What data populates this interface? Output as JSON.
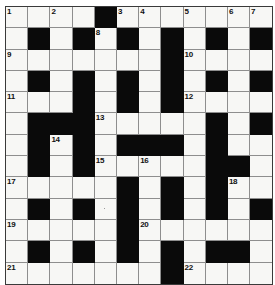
{
  "puzzle": {
    "title": "Crossword Grid",
    "rows": 13,
    "columns": 12,
    "cell_size_px": 22,
    "colors": {
      "block": "#0a0a0a",
      "open": "#f7f7f5",
      "gridline": "#8e8e8e",
      "border": "#3a3a3a",
      "number_text": "#111111",
      "background": "#ffffff"
    },
    "clue_numbers_visible": [
      1,
      2,
      3,
      4,
      5,
      6,
      7,
      8,
      9,
      10,
      11,
      12,
      13,
      14,
      15,
      16,
      17,
      18,
      19,
      20,
      21,
      22
    ],
    "grid": [
      [
        {
          "block": false,
          "num": "1"
        },
        {
          "block": false,
          "num": ""
        },
        {
          "block": false,
          "num": "2"
        },
        {
          "block": false,
          "num": ""
        },
        {
          "block": true,
          "num": ""
        },
        {
          "block": false,
          "num": "3"
        },
        {
          "block": false,
          "num": "4"
        },
        {
          "block": false,
          "num": ""
        },
        {
          "block": false,
          "num": "5"
        },
        {
          "block": false,
          "num": ""
        },
        {
          "block": false,
          "num": "6"
        },
        {
          "block": false,
          "num": "7"
        }
      ],
      [
        {
          "block": false,
          "num": ""
        },
        {
          "block": true,
          "num": ""
        },
        {
          "block": false,
          "num": ""
        },
        {
          "block": true,
          "num": ""
        },
        {
          "block": false,
          "num": "8"
        },
        {
          "block": true,
          "num": ""
        },
        {
          "block": false,
          "num": ""
        },
        {
          "block": true,
          "num": ""
        },
        {
          "block": false,
          "num": ""
        },
        {
          "block": true,
          "num": ""
        },
        {
          "block": false,
          "num": ""
        },
        {
          "block": true,
          "num": ""
        }
      ],
      [
        {
          "block": false,
          "num": "9"
        },
        {
          "block": false,
          "num": ""
        },
        {
          "block": false,
          "num": ""
        },
        {
          "block": false,
          "num": ""
        },
        {
          "block": false,
          "num": ""
        },
        {
          "block": false,
          "num": ""
        },
        {
          "block": false,
          "num": ""
        },
        {
          "block": true,
          "num": ""
        },
        {
          "block": false,
          "num": "10"
        },
        {
          "block": false,
          "num": ""
        },
        {
          "block": false,
          "num": ""
        },
        {
          "block": false,
          "num": ""
        }
      ],
      [
        {
          "block": false,
          "num": ""
        },
        {
          "block": true,
          "num": ""
        },
        {
          "block": false,
          "num": ""
        },
        {
          "block": true,
          "num": ""
        },
        {
          "block": false,
          "num": ""
        },
        {
          "block": true,
          "num": ""
        },
        {
          "block": false,
          "num": ""
        },
        {
          "block": true,
          "num": ""
        },
        {
          "block": false,
          "num": ""
        },
        {
          "block": true,
          "num": ""
        },
        {
          "block": false,
          "num": ""
        },
        {
          "block": true,
          "num": ""
        }
      ],
      [
        {
          "block": false,
          "num": "11"
        },
        {
          "block": false,
          "num": ""
        },
        {
          "block": false,
          "num": ""
        },
        {
          "block": true,
          "num": ""
        },
        {
          "block": false,
          "num": ""
        },
        {
          "block": true,
          "num": ""
        },
        {
          "block": false,
          "num": ""
        },
        {
          "block": true,
          "num": ""
        },
        {
          "block": false,
          "num": "12"
        },
        {
          "block": false,
          "num": ""
        },
        {
          "block": false,
          "num": ""
        },
        {
          "block": false,
          "num": ""
        }
      ],
      [
        {
          "block": false,
          "num": ""
        },
        {
          "block": true,
          "num": ""
        },
        {
          "block": true,
          "num": ""
        },
        {
          "block": true,
          "num": ""
        },
        {
          "block": false,
          "num": "13"
        },
        {
          "block": false,
          "num": ""
        },
        {
          "block": false,
          "num": ""
        },
        {
          "block": false,
          "num": ""
        },
        {
          "block": false,
          "num": ""
        },
        {
          "block": true,
          "num": ""
        },
        {
          "block": false,
          "num": ""
        },
        {
          "block": true,
          "num": ""
        }
      ],
      [
        {
          "block": false,
          "num": ""
        },
        {
          "block": true,
          "num": ""
        },
        {
          "block": false,
          "num": "14"
        },
        {
          "block": true,
          "num": ""
        },
        {
          "block": false,
          "num": ""
        },
        {
          "block": true,
          "num": ""
        },
        {
          "block": true,
          "num": ""
        },
        {
          "block": true,
          "num": ""
        },
        {
          "block": false,
          "num": ""
        },
        {
          "block": true,
          "num": ""
        },
        {
          "block": false,
          "num": ""
        },
        {
          "block": false,
          "num": ""
        }
      ],
      [
        {
          "block": false,
          "num": ""
        },
        {
          "block": true,
          "num": ""
        },
        {
          "block": false,
          "num": ""
        },
        {
          "block": true,
          "num": ""
        },
        {
          "block": false,
          "num": "15"
        },
        {
          "block": false,
          "num": ""
        },
        {
          "block": false,
          "num": "16"
        },
        {
          "block": false,
          "num": ""
        },
        {
          "block": false,
          "num": ""
        },
        {
          "block": true,
          "num": ""
        },
        {
          "block": true,
          "num": ""
        },
        {
          "block": false,
          "num": ""
        }
      ],
      [
        {
          "block": false,
          "num": "17"
        },
        {
          "block": false,
          "num": ""
        },
        {
          "block": false,
          "num": ""
        },
        {
          "block": false,
          "num": ""
        },
        {
          "block": false,
          "num": ""
        },
        {
          "block": true,
          "num": ""
        },
        {
          "block": false,
          "num": ""
        },
        {
          "block": true,
          "num": ""
        },
        {
          "block": false,
          "num": ""
        },
        {
          "block": true,
          "num": ""
        },
        {
          "block": false,
          "num": "18"
        },
        {
          "block": false,
          "num": ""
        }
      ],
      [
        {
          "block": false,
          "num": ""
        },
        {
          "block": true,
          "num": ""
        },
        {
          "block": false,
          "num": ""
        },
        {
          "block": true,
          "num": ""
        },
        {
          "block": false,
          "num": "",
          "dot": true
        },
        {
          "block": true,
          "num": ""
        },
        {
          "block": false,
          "num": ""
        },
        {
          "block": true,
          "num": ""
        },
        {
          "block": false,
          "num": ""
        },
        {
          "block": true,
          "num": ""
        },
        {
          "block": false,
          "num": ""
        },
        {
          "block": true,
          "num": ""
        }
      ],
      [
        {
          "block": false,
          "num": "19"
        },
        {
          "block": false,
          "num": ""
        },
        {
          "block": false,
          "num": ""
        },
        {
          "block": false,
          "num": ""
        },
        {
          "block": false,
          "num": ""
        },
        {
          "block": true,
          "num": ""
        },
        {
          "block": false,
          "num": "20"
        },
        {
          "block": false,
          "num": ""
        },
        {
          "block": false,
          "num": ""
        },
        {
          "block": false,
          "num": ""
        },
        {
          "block": false,
          "num": ""
        },
        {
          "block": false,
          "num": ""
        }
      ],
      [
        {
          "block": false,
          "num": ""
        },
        {
          "block": true,
          "num": ""
        },
        {
          "block": false,
          "num": ""
        },
        {
          "block": true,
          "num": ""
        },
        {
          "block": false,
          "num": ""
        },
        {
          "block": true,
          "num": ""
        },
        {
          "block": false,
          "num": ""
        },
        {
          "block": true,
          "num": ""
        },
        {
          "block": false,
          "num": ""
        },
        {
          "block": true,
          "num": ""
        },
        {
          "block": true,
          "num": ""
        },
        {
          "block": false,
          "num": ""
        }
      ],
      [
        {
          "block": false,
          "num": "21"
        },
        {
          "block": false,
          "num": ""
        },
        {
          "block": false,
          "num": ""
        },
        {
          "block": false,
          "num": ""
        },
        {
          "block": false,
          "num": ""
        },
        {
          "block": false,
          "num": ""
        },
        {
          "block": false,
          "num": ""
        },
        {
          "block": true,
          "num": ""
        },
        {
          "block": false,
          "num": "22"
        },
        {
          "block": false,
          "num": ""
        },
        {
          "block": false,
          "num": ""
        },
        {
          "block": false,
          "num": ""
        }
      ]
    ]
  }
}
